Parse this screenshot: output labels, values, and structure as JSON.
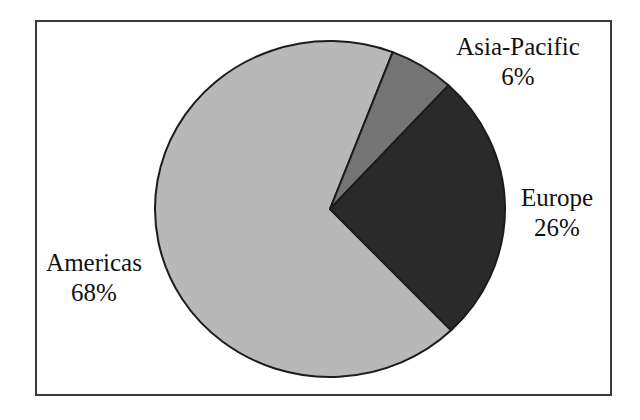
{
  "figure": {
    "background_color": "#ffffff",
    "frame_color": "#3a3a3a",
    "slice_outline_color": "#1c1c1c"
  },
  "chart_data": {
    "type": "pie",
    "title": "",
    "subtitle": "",
    "xlabel": "",
    "ylabel": "",
    "legend_position": "none",
    "grid": false,
    "units": "percent",
    "total": 100,
    "start_angle_deg": 21,
    "direction": "clockwise",
    "categories": [
      "Asia-Pacific",
      "Europe",
      "Americas"
    ],
    "values": [
      6,
      26,
      68
    ],
    "colors": [
      "#757575",
      "#2a2a2a",
      "#b8b8b8"
    ],
    "slices": [
      {
        "name": "Asia-Pacific",
        "value": 6,
        "value_label": "6%",
        "color": "#757575",
        "start_angle_deg": 21.0,
        "end_angle_deg": 42.6,
        "label_position": "outside-top-right"
      },
      {
        "name": "Europe",
        "value": 26,
        "value_label": "26%",
        "color": "#2a2a2a",
        "start_angle_deg": 42.6,
        "end_angle_deg": 136.2,
        "label_position": "outside-right"
      },
      {
        "name": "Americas",
        "value": 68,
        "value_label": "68%",
        "color": "#b8b8b8",
        "start_angle_deg": 136.2,
        "end_angle_deg": 381.0,
        "label_position": "outside-left"
      }
    ],
    "annotations": []
  },
  "labels": {
    "asia_pacific": {
      "name": "Asia-Pacific",
      "value": "6%"
    },
    "europe": {
      "name": "Europe",
      "value": "26%"
    },
    "americas": {
      "name": "Americas",
      "value": "68%"
    }
  }
}
